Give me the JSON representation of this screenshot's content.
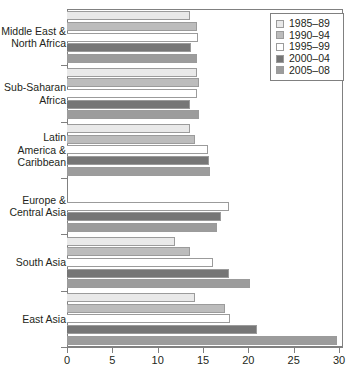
{
  "chart_data": {
    "type": "bar",
    "orientation": "horizontal",
    "title": "",
    "subtitle": "",
    "xlabel": "",
    "ylabel": "",
    "xlim": [
      0,
      30
    ],
    "xticks": [
      0,
      5,
      10,
      15,
      20,
      25,
      30
    ],
    "xtick_labels": [
      "0",
      "5",
      "10",
      "15",
      "20",
      "25",
      "30"
    ],
    "grid": false,
    "legend_position": "top-right",
    "categories": [
      "Middle East &\nNorth Africa",
      "Sub-Saharan\nAfrica",
      "Latin\nAmerica &\nCaribbean",
      "Europe &\nCentral Asia",
      "South Asia",
      "East Asia"
    ],
    "series": [
      {
        "name": "1985–89",
        "color": "#e9e9e9",
        "values": [
          13.6,
          14.3,
          13.6,
          null,
          11.9,
          14.1
        ]
      },
      {
        "name": "1990–94",
        "color": "#bcbcbc",
        "values": [
          14.3,
          14.6,
          14.1,
          null,
          13.6,
          17.4
        ]
      },
      {
        "name": "1995–99",
        "color": "#ffffff",
        "values": [
          14.4,
          14.3,
          15.6,
          17.9,
          16.1,
          18.0
        ]
      },
      {
        "name": "2000–04",
        "color": "#767676",
        "values": [
          13.7,
          13.6,
          15.7,
          17.0,
          17.9,
          21.0
        ]
      },
      {
        "name": "2005–08",
        "color": "#9c9c9c",
        "values": [
          14.3,
          14.6,
          15.8,
          16.5,
          20.2,
          29.8
        ]
      }
    ]
  },
  "legend": {
    "entries": [
      {
        "label": "1985–89",
        "color": "#e9e9e9"
      },
      {
        "label": "1990–94",
        "color": "#bcbcbc"
      },
      {
        "label": "1995–99",
        "color": "#ffffff"
      },
      {
        "label": "2000–04",
        "color": "#767676"
      },
      {
        "label": "2005–08",
        "color": "#9c9c9c"
      }
    ]
  }
}
